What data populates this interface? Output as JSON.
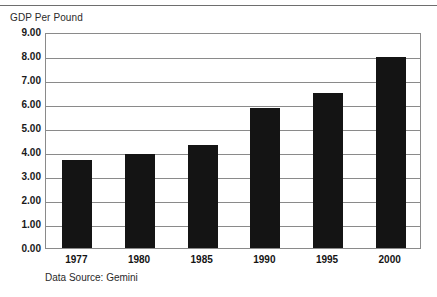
{
  "figure": {
    "axis_caption": "GDP Per Pound",
    "source_note": "Data Source: Gemini"
  },
  "chart_data": {
    "type": "bar",
    "title": "GDP Per Pound",
    "xlabel": "",
    "ylabel": "GDP Per Pound",
    "categories": [
      "1977",
      "1980",
      "1985",
      "1990",
      "1995",
      "2000"
    ],
    "values": [
      3.65,
      3.92,
      4.28,
      5.85,
      6.45,
      7.95
    ],
    "ylim": [
      0.0,
      9.0
    ],
    "ytick_step": 1.0,
    "ytick_labels": [
      "9.00",
      "8.00",
      "7.00",
      "6.00",
      "5.00",
      "4.00",
      "3.00",
      "2.00",
      "1.00",
      "0.00"
    ],
    "ytick_values": [
      9.0,
      8.0,
      7.0,
      6.0,
      5.0,
      4.0,
      3.0,
      2.0,
      1.0,
      0.0
    ],
    "grid": true,
    "legend": false,
    "bar_color": "#141414",
    "grid_color": "#8a8a8a",
    "annotation": "Data Source: Gemini"
  }
}
